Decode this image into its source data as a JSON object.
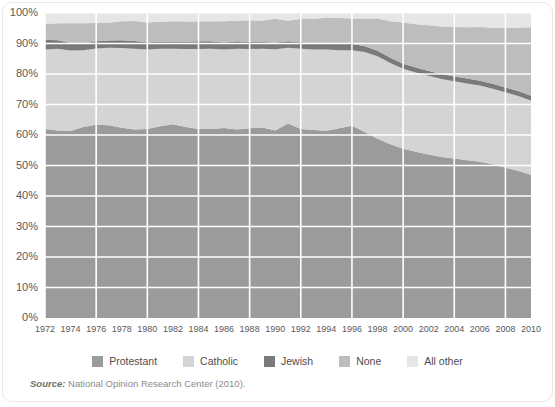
{
  "chart_data": {
    "type": "area",
    "title": "",
    "subtitle": "",
    "xlabel": "",
    "ylabel": "",
    "stacked": true,
    "grid": true,
    "legend_position": "bottom",
    "xlim": [
      1972,
      2010
    ],
    "ylim": [
      0,
      100
    ],
    "ytick_values": [
      0,
      10,
      20,
      30,
      40,
      50,
      60,
      70,
      80,
      90,
      100
    ],
    "ytick_labels": [
      "0%",
      "10%",
      "20%",
      "30%",
      "40%",
      "50%",
      "60%",
      "70%",
      "80%",
      "90%",
      "100%"
    ],
    "x": [
      1972,
      1973,
      1974,
      1975,
      1976,
      1977,
      1978,
      1979,
      1980,
      1981,
      1982,
      1983,
      1984,
      1985,
      1986,
      1987,
      1988,
      1989,
      1990,
      1991,
      1992,
      1993,
      1994,
      1995,
      1996,
      1997,
      1998,
      1999,
      2000,
      2001,
      2002,
      2003,
      2004,
      2005,
      2006,
      2007,
      2008,
      2009,
      2010
    ],
    "xtick_labels": [
      "1972",
      "1974",
      "1976",
      "1978",
      "1980",
      "1982",
      "1984",
      "1986",
      "1988",
      "1990",
      "1992",
      "1994",
      "1996",
      "1998",
      "2000",
      "2002",
      "2004",
      "2006",
      "2008",
      "2010"
    ],
    "series": [
      {
        "name": "Protestant",
        "color": "#9b9b9b",
        "values": [
          62.0,
          61.5,
          61.3,
          62.6,
          63.4,
          63.2,
          62.4,
          61.8,
          62.0,
          62.9,
          63.5,
          62.6,
          62.0,
          62.0,
          62.3,
          61.8,
          62.2,
          62.5,
          61.5,
          63.8,
          62.0,
          61.6,
          61.4,
          62.2,
          63.0,
          61.0,
          58.8,
          57.0,
          55.5,
          54.5,
          53.6,
          52.8,
          52.3,
          51.7,
          51.2,
          50.4,
          49.3,
          48.2,
          47.0
        ]
      },
      {
        "name": "Catholic",
        "color": "#d4d4d4",
        "values": [
          26.0,
          26.8,
          26.4,
          25.2,
          25.0,
          25.4,
          26.1,
          26.5,
          26.0,
          25.4,
          24.8,
          25.6,
          26.2,
          26.3,
          25.7,
          26.5,
          26.0,
          25.8,
          26.6,
          24.8,
          26.3,
          26.4,
          26.6,
          25.6,
          24.8,
          26.2,
          27.0,
          26.6,
          26.2,
          26.0,
          25.8,
          25.6,
          25.3,
          25.2,
          25.0,
          24.8,
          24.7,
          24.6,
          24.3
        ]
      },
      {
        "name": "Jewish",
        "color": "#7a7a7a",
        "values": [
          3.2,
          2.8,
          2.5,
          2.2,
          2.3,
          2.4,
          2.6,
          2.5,
          2.4,
          2.3,
          2.2,
          2.3,
          2.5,
          2.4,
          2.3,
          2.4,
          2.3,
          2.2,
          2.2,
          2.1,
          2.2,
          2.0,
          2.1,
          2.0,
          2.1,
          1.9,
          1.8,
          1.7,
          1.7,
          1.6,
          1.6,
          1.6,
          1.6,
          1.6,
          1.6,
          1.6,
          1.6,
          1.6,
          1.6
        ]
      },
      {
        "name": "None",
        "color": "#bdbdbd",
        "values": [
          5.2,
          5.5,
          6.4,
          6.6,
          6.0,
          5.8,
          6.2,
          6.6,
          6.5,
          6.5,
          6.8,
          6.7,
          6.5,
          6.6,
          7.0,
          6.8,
          7.1,
          7.0,
          7.8,
          6.8,
          7.6,
          8.0,
          8.4,
          8.6,
          8.3,
          9.0,
          10.6,
          12.0,
          13.5,
          14.2,
          15.0,
          15.6,
          16.2,
          16.8,
          17.6,
          18.4,
          19.5,
          20.8,
          22.4
        ]
      },
      {
        "name": "All other",
        "color": "#e6e6e6",
        "values": [
          3.6,
          3.4,
          3.4,
          3.4,
          3.3,
          3.2,
          2.7,
          2.6,
          3.1,
          2.9,
          2.7,
          2.8,
          2.8,
          2.7,
          2.7,
          2.5,
          2.4,
          2.5,
          1.9,
          2.5,
          1.9,
          2.0,
          1.5,
          1.6,
          1.8,
          1.9,
          1.8,
          2.7,
          3.1,
          3.7,
          4.0,
          4.4,
          4.6,
          4.7,
          4.6,
          4.8,
          4.9,
          4.8,
          4.7
        ]
      }
    ]
  },
  "legend": {
    "items": [
      {
        "label": "Protestant",
        "color": "#9b9b9b"
      },
      {
        "label": "Catholic",
        "color": "#d4d4d4"
      },
      {
        "label": "Jewish",
        "color": "#7a7a7a"
      },
      {
        "label": "None",
        "color": "#bdbdbd"
      },
      {
        "label": "All other",
        "color": "#e6e6e6"
      }
    ]
  },
  "source": {
    "lead": "Source:",
    "text": " National Opinion Research Center (2010)."
  },
  "style": {
    "gridline_color": "#ffffff",
    "axis_text_color": "#58595b",
    "background": "#ffffff"
  }
}
